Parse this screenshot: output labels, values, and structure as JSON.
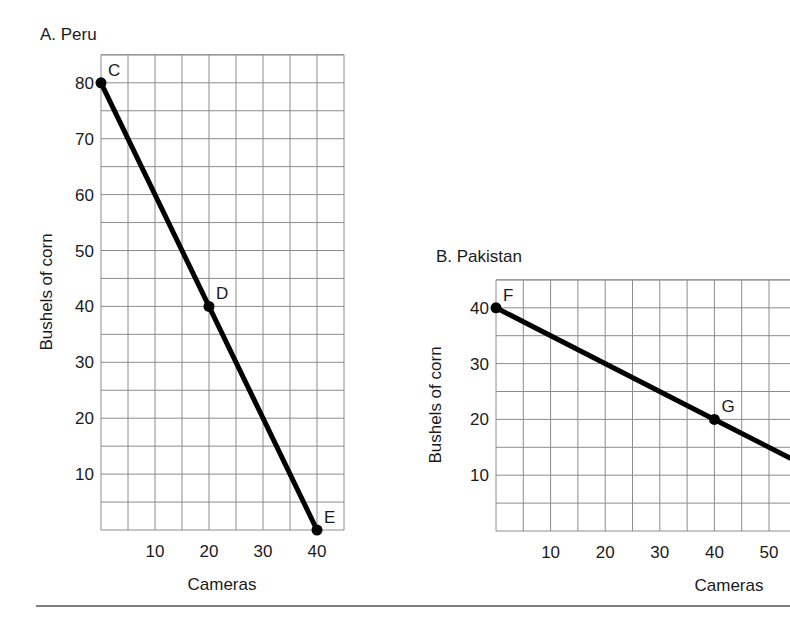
{
  "chart_data": [
    {
      "type": "line",
      "title": "A. Peru",
      "xlabel": "Cameras",
      "ylabel": "Bushels of corn",
      "xlim": [
        0,
        45
      ],
      "ylim": [
        0,
        85
      ],
      "x_ticks": [
        10,
        20,
        30,
        40
      ],
      "y_ticks": [
        10,
        20,
        30,
        40,
        50,
        60,
        70,
        80
      ],
      "grid": true,
      "grid_step": {
        "x": 5,
        "y": 5
      },
      "series": [
        {
          "name": "Production possibilities frontier",
          "x": [
            0,
            20,
            40
          ],
          "y": [
            80,
            40,
            0
          ]
        }
      ],
      "points": [
        {
          "label": "C",
          "x": 0,
          "y": 80
        },
        {
          "label": "D",
          "x": 20,
          "y": 40
        },
        {
          "label": "E",
          "x": 40,
          "y": 0
        }
      ]
    },
    {
      "type": "line",
      "title": "B. Pakistan",
      "xlabel": "Cameras",
      "ylabel": "Bushels of corn",
      "xlim": [
        0,
        55
      ],
      "ylim": [
        0,
        45
      ],
      "x_ticks": [
        10,
        20,
        30,
        40,
        50
      ],
      "y_ticks": [
        10,
        20,
        30,
        40
      ],
      "grid": true,
      "grid_step": {
        "x": 5,
        "y": 5
      },
      "series": [
        {
          "name": "Production possibilities frontier",
          "x": [
            0,
            40,
            54
          ],
          "y": [
            40,
            20,
            13
          ]
        }
      ],
      "points": [
        {
          "label": "F",
          "x": 0,
          "y": 40
        },
        {
          "label": "G",
          "x": 40,
          "y": 20
        }
      ]
    }
  ],
  "panels": {
    "peru": {
      "title": "A. Peru",
      "xlabel": "Cameras",
      "ylabel": "Bushels of corn"
    },
    "pakistan": {
      "title": "B. Pakistan",
      "xlabel": "Cameras",
      "ylabel": "Bushels of corn"
    }
  }
}
